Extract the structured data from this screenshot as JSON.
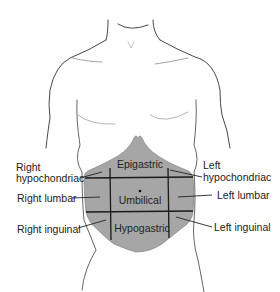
{
  "diagram": {
    "type": "anatomical",
    "shade_color": "#a6a6a6",
    "line_color": "#1a1a1a",
    "regions": {
      "epigastric": "Epigastric",
      "umbilical": "Umbilical",
      "hypogastric": "Hypogastric"
    },
    "labels": {
      "right_hypochondriac_1": "Right",
      "right_hypochondriac_2": "hypochondriac",
      "right_lumbar": "Right lumbar",
      "right_inguinal": "Right inguinal",
      "left_hypochondriac_1": "Left",
      "left_hypochondriac_2": "hypochondriac",
      "left_lumbar": "Left lumbar",
      "left_inguinal": "Left inguinal"
    }
  }
}
